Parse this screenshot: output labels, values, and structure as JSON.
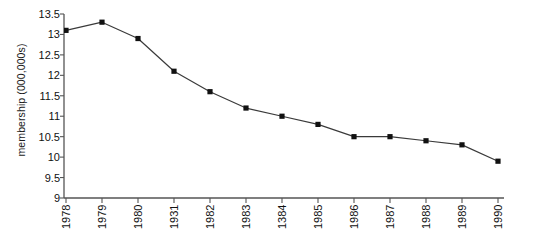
{
  "chart_data": {
    "type": "line",
    "title": "",
    "xlabel": "",
    "ylabel": "membership (000,000s)",
    "categories": [
      "1978",
      "1979",
      "1980",
      "1931",
      "1982",
      "1983",
      "1384",
      "1985",
      "1986",
      "1987",
      "1988",
      "1989",
      "1990"
    ],
    "values": [
      13.1,
      13.3,
      12.9,
      12.1,
      11.6,
      11.2,
      11.0,
      10.8,
      10.5,
      10.5,
      10.4,
      10.3,
      9.9
    ],
    "series": [
      {
        "name": "membership",
        "values": [
          13.1,
          13.3,
          12.9,
          12.1,
          11.6,
          11.2,
          11.0,
          10.8,
          10.5,
          10.5,
          10.4,
          10.3,
          9.9
        ]
      }
    ],
    "ylim": [
      9,
      13.5
    ],
    "ytick_labels": [
      "13.5",
      "13",
      "12.5",
      "12",
      "11.5",
      "11",
      "10.5",
      "10",
      "9.5",
      "9"
    ],
    "ytick_values": [
      13.5,
      13,
      12.5,
      12,
      11.5,
      11,
      10.5,
      10,
      9.5,
      9
    ],
    "grid": false,
    "legend": "none",
    "marker": "square",
    "line_color": "#3a3a3a",
    "marker_color": "#111111",
    "axis_color": "#555555"
  }
}
